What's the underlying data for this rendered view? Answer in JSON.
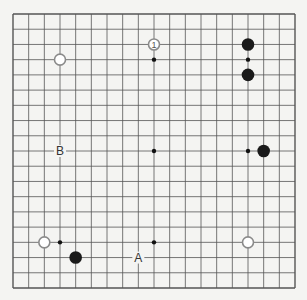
{
  "board": {
    "size": 19,
    "left": 13,
    "top": 14,
    "right": 295,
    "bottom": 288,
    "line_color": "#555555",
    "background": "#f4f4f2",
    "star_points": [
      [
        3,
        3
      ],
      [
        9,
        3
      ],
      [
        15,
        3
      ],
      [
        3,
        9
      ],
      [
        9,
        9
      ],
      [
        15,
        9
      ],
      [
        3,
        15
      ],
      [
        9,
        15
      ],
      [
        15,
        15
      ]
    ]
  },
  "stones": [
    {
      "color": "white",
      "col": 3,
      "row": 3
    },
    {
      "color": "white",
      "col": 9,
      "row": 2,
      "label": "1"
    },
    {
      "color": "black",
      "col": 15,
      "row": 2
    },
    {
      "color": "black",
      "col": 15,
      "row": 4
    },
    {
      "color": "black",
      "col": 16,
      "row": 9
    },
    {
      "color": "white",
      "col": 2,
      "row": 15
    },
    {
      "color": "black",
      "col": 4,
      "row": 16
    },
    {
      "color": "white",
      "col": 15,
      "row": 15
    }
  ],
  "labels": [
    {
      "text": "B",
      "col": 3,
      "row": 9
    },
    {
      "text": "A",
      "col": 8,
      "row": 16
    }
  ]
}
